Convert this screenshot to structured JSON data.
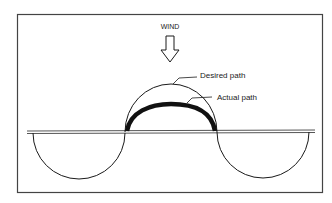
{
  "diagram": {
    "wind_label": "WIND",
    "desired_label": "Desired path",
    "actual_label": "Actual path",
    "colors": {
      "ink": "#1a1a1a",
      "frame": "#444444",
      "baseline": "#555555"
    }
  }
}
